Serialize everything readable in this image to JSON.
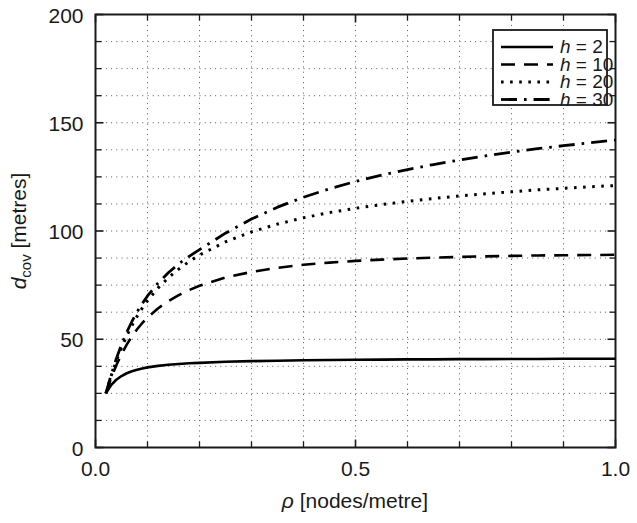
{
  "chart_data": {
    "type": "line",
    "title": "",
    "xlabel": "ρ [nodes/metre]",
    "ylabel": "d_cov [metres]",
    "ylabel_main": "d",
    "ylabel_sub": "cov",
    "ylabel_unit": " [metres]",
    "xlabel_symbol": "ρ",
    "xlabel_unit": " [nodes/metre]",
    "xlim": [
      0.0,
      1.0
    ],
    "ylim": [
      0,
      200
    ],
    "xticks": [
      0.0,
      0.5,
      1.0
    ],
    "xticklabels": [
      "0.0",
      "0.5",
      "1.0"
    ],
    "yticks": [
      0,
      50,
      100,
      150,
      200
    ],
    "yticklabels": [
      "0",
      "50",
      "100",
      "150",
      "200"
    ],
    "x_minor_step": 0.1,
    "y_minor_step": 12.5,
    "grid": true,
    "grid_style": "dotted",
    "legend_position": "top-right",
    "series": [
      {
        "name": "h = 2",
        "label_symbol": "h",
        "label_value": "2",
        "h": 2,
        "style": "solid",
        "dash": "none",
        "linewidth": 2.6,
        "color": "#000000",
        "asymptote": 41,
        "x": [
          0.02,
          0.03,
          0.04,
          0.05,
          0.06,
          0.07,
          0.08,
          0.09,
          0.1,
          0.12,
          0.14,
          0.16,
          0.18,
          0.2,
          0.25,
          0.3,
          0.35,
          0.4,
          0.45,
          0.5,
          0.55,
          0.6,
          0.65,
          0.7,
          0.75,
          0.8,
          0.85,
          0.9,
          0.95,
          1.0
        ],
        "y": [
          25.0,
          28.8,
          31.3,
          33.0,
          34.3,
          35.2,
          35.9,
          36.5,
          37.0,
          37.7,
          38.2,
          38.6,
          38.9,
          39.1,
          39.6,
          39.9,
          40.1,
          40.3,
          40.4,
          40.5,
          40.6,
          40.7,
          40.7,
          40.8,
          40.8,
          40.9,
          40.9,
          41.0,
          41.0,
          41.0
        ]
      },
      {
        "name": "h = 10",
        "label_symbol": "h",
        "label_value": "10",
        "h": 10,
        "style": "dashed",
        "dash": "14 9",
        "linewidth": 2.6,
        "color": "#000000",
        "asymptote": 89,
        "x": [
          0.02,
          0.03,
          0.04,
          0.05,
          0.06,
          0.07,
          0.08,
          0.09,
          0.1,
          0.12,
          0.14,
          0.16,
          0.18,
          0.2,
          0.25,
          0.3,
          0.35,
          0.4,
          0.45,
          0.5,
          0.55,
          0.6,
          0.65,
          0.7,
          0.75,
          0.8,
          0.85,
          0.9,
          0.95,
          1.0
        ],
        "y": [
          25.0,
          32.0,
          38.0,
          43.0,
          47.5,
          51.3,
          54.6,
          57.5,
          60.0,
          64.2,
          67.6,
          70.4,
          72.7,
          74.7,
          78.5,
          81.1,
          83.0,
          84.4,
          85.4,
          86.2,
          86.8,
          87.3,
          87.7,
          88.0,
          88.3,
          88.5,
          88.7,
          88.8,
          88.9,
          89.0
        ]
      },
      {
        "name": "h = 20",
        "label_symbol": "h",
        "label_value": "20",
        "h": 20,
        "style": "dotted",
        "dash": "2.6 6.5",
        "linewidth": 3.0,
        "color": "#000000",
        "asymptote": 123,
        "x": [
          0.02,
          0.03,
          0.04,
          0.05,
          0.06,
          0.07,
          0.08,
          0.09,
          0.1,
          0.12,
          0.14,
          0.16,
          0.18,
          0.2,
          0.25,
          0.3,
          0.35,
          0.4,
          0.45,
          0.5,
          0.55,
          0.6,
          0.65,
          0.7,
          0.75,
          0.8,
          0.85,
          0.9,
          0.95,
          1.0
        ],
        "y": [
          25.0,
          33.0,
          40.0,
          46.0,
          51.5,
          56.3,
          60.6,
          64.4,
          67.8,
          73.6,
          78.4,
          82.4,
          85.9,
          88.9,
          95.0,
          99.6,
          103.2,
          106.1,
          108.5,
          110.5,
          112.2,
          113.7,
          115.0,
          116.2,
          117.2,
          118.1,
          119.0,
          119.7,
          120.4,
          121.0
        ]
      },
      {
        "name": "h = 30",
        "label_symbol": "h",
        "label_value": "30",
        "h": 30,
        "style": "dashdot",
        "dash": "16 7 2.6 7",
        "linewidth": 2.8,
        "color": "#000000",
        "asymptote": 145,
        "x": [
          0.02,
          0.03,
          0.04,
          0.05,
          0.06,
          0.07,
          0.08,
          0.09,
          0.1,
          0.12,
          0.14,
          0.16,
          0.18,
          0.2,
          0.25,
          0.3,
          0.35,
          0.4,
          0.45,
          0.5,
          0.55,
          0.6,
          0.65,
          0.7,
          0.75,
          0.8,
          0.85,
          0.9,
          0.95,
          1.0
        ],
        "y": [
          25.0,
          33.5,
          41.0,
          47.5,
          53.2,
          58.2,
          62.6,
          66.5,
          70.0,
          75.9,
          80.7,
          84.8,
          88.3,
          91.4,
          99.0,
          105.5,
          111.0,
          115.6,
          119.5,
          122.9,
          125.8,
          128.4,
          130.7,
          132.8,
          134.7,
          136.4,
          138.0,
          139.4,
          140.7,
          142.0
        ]
      }
    ]
  },
  "legend": {
    "entries": [
      {
        "text": "h = 2"
      },
      {
        "text": "h = 10"
      },
      {
        "text": "h = 20"
      },
      {
        "text": "h = 30"
      }
    ]
  }
}
